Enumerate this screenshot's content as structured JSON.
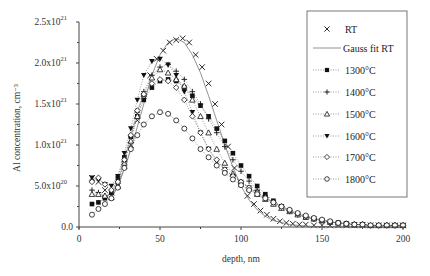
{
  "chart_data": {
    "type": "scatter",
    "title": "",
    "xlabel": "depth, nm",
    "ylabel": "Al concentration, cm⁻³",
    "xlim": [
      0,
      200
    ],
    "ylim": [
      0,
      2.5e+21
    ],
    "x_ticks": [
      {
        "value": 0,
        "label": "0"
      },
      {
        "value": 50,
        "label": "50"
      },
      {
        "value": 100,
        "label": "100"
      },
      {
        "value": 150,
        "label": "150"
      },
      {
        "value": 200,
        "label": "200"
      }
    ],
    "y_ticks": [
      {
        "value": 0,
        "label": "0.0",
        "exp": ""
      },
      {
        "value": 5e+20,
        "label": "5.0x10",
        "exp": "20"
      },
      {
        "value": 1e+21,
        "label": "1.0x10",
        "exp": "21"
      },
      {
        "value": 1.5e+21,
        "label": "1.5x10",
        "exp": "21"
      },
      {
        "value": 2e+21,
        "label": "2.0x10",
        "exp": "21"
      },
      {
        "value": 2.5e+21,
        "label": "2.5x10",
        "exp": "21"
      }
    ],
    "grid": false,
    "legend_position": "upper right",
    "series": [
      {
        "name": "RT",
        "marker": "x",
        "line": "none",
        "x": [
          8,
          12,
          16,
          20,
          24,
          28,
          32,
          36,
          40,
          44,
          48,
          52,
          56,
          60,
          64,
          68,
          72,
          76,
          80,
          84,
          88,
          92,
          96,
          100,
          104,
          108,
          112,
          116,
          120,
          124,
          128,
          132,
          136,
          140,
          145,
          150,
          155,
          160,
          165,
          170,
          175,
          180,
          185,
          190,
          195,
          200
        ],
        "y": [
          6e+20,
          5.5e+20,
          4.5e+20,
          4.2e+20,
          5e+20,
          7.5e+20,
          1e+21,
          1.3e+21,
          1.6e+21,
          1.85e+21,
          2.05e+21,
          2.15e+21,
          2.25e+21,
          2.28e+21,
          2.3e+21,
          2.25e+21,
          2.1e+21,
          1.95e+21,
          1.75e+21,
          1.5e+21,
          1.25e+21,
          9.8e+20,
          7.2e+20,
          5.2e+20,
          3.8e+20,
          2.8e+20,
          2e+20,
          1.5e+20,
          1e+20,
          7e+19,
          5e+19,
          4e+19,
          3e+19,
          3e+19,
          2e+19,
          2e+19,
          2e+19,
          2e+19,
          2e+19,
          2e+19,
          2e+19,
          2e+19,
          2e+19,
          2e+19,
          2e+19,
          2e+19
        ]
      },
      {
        "name": "Gauss fit RT",
        "marker": "none",
        "line": "solid",
        "x": [
          20,
          25,
          30,
          35,
          40,
          45,
          50,
          55,
          60,
          65,
          70,
          75,
          80,
          85,
          90,
          95,
          100,
          105,
          110,
          115,
          120,
          130,
          140,
          150,
          160,
          170,
          180,
          190,
          200
        ],
        "y": [
          3.5e+20,
          5.5e+20,
          8.2e+20,
          1.15e+21,
          1.5e+21,
          1.85e+21,
          2.1e+21,
          2.25e+21,
          2.3e+21,
          2.25e+21,
          2.1e+21,
          1.88e+21,
          1.6e+21,
          1.3e+21,
          1e+21,
          7.3e+20,
          5e+20,
          3.3e+20,
          2.1e+20,
          1.3e+20,
          8e+19,
          3e+19,
          1e+19,
          5e+18,
          2e+18,
          1e+18,
          0,
          0,
          0
        ]
      },
      {
        "name": "1300°C",
        "marker": "square-filled",
        "line": "dotted",
        "x": [
          8,
          12,
          16,
          20,
          24,
          28,
          32,
          36,
          40,
          45,
          50,
          55,
          60,
          65,
          70,
          75,
          80,
          85,
          90,
          95,
          100,
          105,
          110,
          115,
          120,
          125,
          130,
          135,
          140,
          145,
          150,
          155,
          160,
          165,
          170,
          175,
          180,
          185,
          190,
          195,
          200
        ],
        "y": [
          2.8e+20,
          3e+20,
          3.5e+20,
          4.2e+20,
          6e+20,
          8.5e+20,
          1.1e+21,
          1.35e+21,
          1.55e+21,
          1.7e+21,
          1.78e+21,
          1.8e+21,
          1.78e+21,
          1.7e+21,
          1.6e+21,
          1.48e+21,
          1.35e+21,
          1.2e+21,
          1.05e+21,
          9e+20,
          7.5e+20,
          6.2e+20,
          5e+20,
          4e+20,
          3.2e+20,
          2.5e+20,
          2e+20,
          1.5e+20,
          1.2e+20,
          1e+20,
          8e+19,
          6e+19,
          5e+19,
          4e+19,
          3e+19,
          3e+19,
          2e+19,
          2e+19,
          2e+19,
          2e+19,
          2e+19
        ]
      },
      {
        "name": "1400°C",
        "marker": "plus",
        "line": "dotted",
        "x": [
          8,
          12,
          16,
          20,
          24,
          28,
          32,
          36,
          40,
          45,
          50,
          55,
          60,
          65,
          70,
          75,
          80,
          85,
          90,
          95,
          100,
          105,
          110,
          115,
          120,
          125,
          130,
          135,
          140,
          145,
          150,
          155,
          160,
          165,
          170,
          175,
          180,
          185,
          190,
          195,
          200
        ],
        "y": [
          4.5e+20,
          4.2e+20,
          3.8e+20,
          4e+20,
          5.5e+20,
          8e+20,
          1.1e+21,
          1.4e+21,
          1.65e+21,
          1.85e+21,
          1.95e+21,
          1.98e+21,
          1.9e+21,
          1.8e+21,
          1.65e+21,
          1.5e+21,
          1.32e+21,
          1.15e+21,
          9.8e+20,
          8.2e+20,
          6.8e+20,
          5.6e+20,
          4.5e+20,
          3.7e+20,
          3e+20,
          2.4e+20,
          1.9e+20,
          1.5e+20,
          1.2e+20,
          1e+20,
          8e+19,
          6e+19,
          5e+19,
          4e+19,
          3e+19,
          3e+19,
          2e+19,
          2e+19,
          2e+19,
          2e+19,
          2e+19
        ]
      },
      {
        "name": "1500°C",
        "marker": "triangle-open",
        "line": "dotted",
        "x": [
          8,
          12,
          16,
          20,
          24,
          28,
          32,
          36,
          40,
          45,
          50,
          55,
          60,
          65,
          70,
          75,
          80,
          85,
          90,
          95,
          100,
          105,
          110,
          115,
          120,
          125,
          130,
          135,
          140,
          145,
          150,
          155,
          160,
          165,
          170,
          175,
          180,
          185,
          190,
          195,
          200
        ],
        "y": [
          4e+20,
          4e+20,
          3.8e+20,
          3.6e+20,
          5e+20,
          7.8e+20,
          1.05e+21,
          1.35e+21,
          1.62e+21,
          1.82e+21,
          1.92e+21,
          1.88e+21,
          1.8e+21,
          1.72e+21,
          1.55e+21,
          1.35e+21,
          1.15e+21,
          9.5e+20,
          7.8e+20,
          6.5e+20,
          5.5e+20,
          4.7e+20,
          4e+20,
          3.4e+20,
          2.8e+20,
          2.3e+20,
          1.9e+20,
          1.5e+20,
          1.2e+20,
          1e+20,
          8e+19,
          6e+19,
          5e+19,
          4e+19,
          3e+19,
          3e+19,
          2e+19,
          2e+19,
          2e+19,
          2e+19,
          2e+19
        ]
      },
      {
        "name": "1600°C",
        "marker": "triangle-down-filled",
        "line": "dotted",
        "x": [
          8,
          12,
          16,
          20,
          24,
          28,
          32,
          36,
          40,
          45,
          50,
          55,
          60,
          65,
          70,
          75,
          80,
          85,
          90,
          95,
          100,
          105,
          110,
          115,
          120,
          125,
          130,
          135,
          140,
          145,
          150,
          155,
          160,
          165,
          170,
          175,
          180,
          185,
          190,
          195,
          200
        ],
        "y": [
          6e+20,
          5.8e+20,
          5.2e+20,
          5e+20,
          6.2e+20,
          9e+20,
          1.2e+21,
          1.55e+21,
          1.85e+21,
          2.02e+21,
          2.05e+21,
          1.98e+21,
          1.85e+21,
          1.65e+21,
          1.4e+21,
          1.15e+21,
          9.5e+20,
          8e+20,
          7e+20,
          6.2e+20,
          5.5e+20,
          4.8e+20,
          4.2e+20,
          3.6e+20,
          3e+20,
          2.5e+20,
          2e+20,
          1.6e+20,
          1.3e+20,
          1e+20,
          8e+19,
          6e+19,
          5e+19,
          4e+19,
          3e+19,
          3e+19,
          2e+19,
          2e+19,
          2e+19,
          2e+19,
          2e+19
        ]
      },
      {
        "name": "1700°C",
        "marker": "diamond-open",
        "line": "dotted",
        "x": [
          8,
          12,
          16,
          20,
          24,
          28,
          32,
          36,
          40,
          45,
          50,
          55,
          60,
          65,
          70,
          75,
          80,
          85,
          90,
          95,
          100,
          105,
          110,
          115,
          120,
          125,
          130,
          135,
          140,
          145,
          150,
          155,
          160,
          165,
          170,
          175,
          180,
          185,
          190,
          195,
          200
        ],
        "y": [
          5.5e+20,
          6e+20,
          5.2e+20,
          4.5e+20,
          5.5e+20,
          8.2e+20,
          1.12e+21,
          1.42e+21,
          1.62e+21,
          1.75e+21,
          1.8e+21,
          1.78e+21,
          1.7e+21,
          1.55e+21,
          1.35e+21,
          1.15e+21,
          9.5e+20,
          8.2e+20,
          7e+20,
          6.2e+20,
          5.5e+20,
          4.8e+20,
          4.2e+20,
          3.6e+20,
          3e+20,
          2.5e+20,
          2e+20,
          1.6e+20,
          1.3e+20,
          1e+20,
          8e+19,
          6e+19,
          5e+19,
          4e+19,
          3e+19,
          3e+19,
          2e+19,
          2e+19,
          2e+19,
          2e+19,
          2e+19
        ]
      },
      {
        "name": "1800°C",
        "marker": "circle-open",
        "line": "dotted",
        "x": [
          8,
          12,
          16,
          20,
          24,
          28,
          32,
          36,
          40,
          45,
          50,
          55,
          60,
          65,
          70,
          75,
          80,
          85,
          90,
          95,
          100,
          105,
          110,
          115,
          120,
          125,
          130,
          135,
          140,
          145,
          150,
          155,
          160,
          165,
          170,
          175,
          180,
          185,
          190,
          195,
          200
        ],
        "y": [
          1.5e+20,
          2.2e+20,
          2.8e+20,
          3.5e+20,
          4.8e+20,
          7.2e+20,
          9.5e+20,
          1.12e+21,
          1.25e+21,
          1.35e+21,
          1.4e+21,
          1.38e+21,
          1.3e+21,
          1.2e+21,
          1.08e+21,
          9.5e+20,
          8.5e+20,
          7.5e+20,
          6.6e+20,
          5.8e+20,
          5.1e+20,
          4.5e+20,
          4e+20,
          3.5e+20,
          3e+20,
          2.5e+20,
          2.1e+20,
          1.7e+20,
          1.4e+20,
          1.1e+20,
          9e+19,
          7e+19,
          5e+19,
          4e+19,
          3e+19,
          3e+19,
          2e+19,
          2e+19,
          2e+19,
          2e+19,
          2e+19
        ]
      }
    ]
  },
  "legend": {
    "items": [
      {
        "label": "RT",
        "marker": "x",
        "line": "none"
      },
      {
        "label": "Gauss fit RT",
        "marker": "none",
        "line": "solid"
      },
      {
        "label": "1300°C",
        "marker": "square-filled",
        "line": "dotted"
      },
      {
        "label": "1400°C",
        "marker": "plus",
        "line": "dotted"
      },
      {
        "label": "1500°C",
        "marker": "triangle-open",
        "line": "dotted"
      },
      {
        "label": "1600°C",
        "marker": "triangle-down-filled",
        "line": "dotted"
      },
      {
        "label": "1700°C",
        "marker": "diamond-open",
        "line": "dotted"
      },
      {
        "label": "1800°C",
        "marker": "circle-open",
        "line": "dotted"
      }
    ]
  },
  "colors": {
    "axis": "#444444",
    "marker": "#111111",
    "fit_line": "#777777",
    "background": "#ffffff"
  }
}
